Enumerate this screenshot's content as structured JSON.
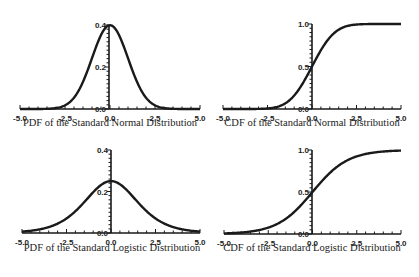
{
  "chart_data": [
    {
      "type": "line",
      "title": "PDF of the Standard Normal Distribution",
      "xlabel": "",
      "ylabel": "",
      "xlim": [
        -5.0,
        5.0
      ],
      "ylim": [
        0.0,
        0.4
      ],
      "x_ticks": [
        "-5.0",
        "-2.5",
        "0.0",
        "2.5",
        "5.0"
      ],
      "y_ticks": [
        "0.0",
        "0.2",
        "0.4"
      ],
      "grid": false,
      "legend": null,
      "function": "normal_pdf",
      "series": [
        {
          "name": "pdf",
          "x": [
            -5,
            -4,
            -3,
            -2.5,
            -2,
            -1.5,
            -1,
            -0.5,
            0,
            0.5,
            1,
            1.5,
            2,
            2.5,
            3,
            4,
            5
          ],
          "y": [
            0.0,
            0.0001,
            0.0044,
            0.0175,
            0.054,
            0.1295,
            0.242,
            0.3521,
            0.3989,
            0.3521,
            0.242,
            0.1295,
            0.054,
            0.0175,
            0.0044,
            0.0001,
            0.0
          ]
        }
      ],
      "box": {
        "x0": 20,
        "x1": 200,
        "y0": 109,
        "y1": 25,
        "axis_x": 109
      }
    },
    {
      "type": "line",
      "title": "CDF of the Standard Normal Distribution",
      "xlabel": "",
      "ylabel": "",
      "xlim": [
        -5.0,
        5.0
      ],
      "ylim": [
        0.0,
        1.0
      ],
      "x_ticks": [
        "-5.0",
        "-2.5",
        "0.0",
        "2.5",
        "5.0"
      ],
      "y_ticks": [
        "0.0",
        "0.5",
        "1.0"
      ],
      "grid": false,
      "legend": null,
      "function": "normal_cdf",
      "series": [
        {
          "name": "cdf",
          "x": [
            -5,
            -3,
            -2.5,
            -2,
            -1.5,
            -1,
            -0.5,
            0,
            0.5,
            1,
            1.5,
            2,
            2.5,
            3,
            5
          ],
          "y": [
            0.0,
            0.0013,
            0.0062,
            0.0228,
            0.0668,
            0.1587,
            0.3085,
            0.5,
            0.6915,
            0.8413,
            0.9332,
            0.9772,
            0.9938,
            0.9987,
            1.0
          ]
        }
      ],
      "box": {
        "x0": 223,
        "x1": 401,
        "y0": 109,
        "y1": 24,
        "axis_x": 312
      }
    },
    {
      "type": "line",
      "title": "PDF of the Standard Logistic Distribution",
      "xlabel": "",
      "ylabel": "",
      "xlim": [
        -5.0,
        5.0
      ],
      "ylim": [
        0.0,
        0.4
      ],
      "x_ticks": [
        "-5.0",
        "-2.5",
        "0.0",
        "2.5",
        "5.0"
      ],
      "y_ticks": [
        "0.0",
        "0.2",
        "0.4"
      ],
      "grid": false,
      "legend": null,
      "function": "logistic_pdf",
      "series": [
        {
          "name": "pdf",
          "x": [
            -5,
            -4,
            -3,
            -2,
            -1,
            0,
            1,
            2,
            3,
            4,
            5
          ],
          "y": [
            0.0066,
            0.0177,
            0.0452,
            0.105,
            0.1966,
            0.25,
            0.1966,
            0.105,
            0.0452,
            0.0177,
            0.0066
          ]
        }
      ],
      "box": {
        "x0": 22,
        "x1": 200,
        "y0": 233,
        "y1": 150,
        "axis_x": 111
      }
    },
    {
      "type": "line",
      "title": "CDF of the Standard Logistic Distribution",
      "xlabel": "",
      "ylabel": "",
      "xlim": [
        -5.0,
        5.0
      ],
      "ylim": [
        0.0,
        1.0
      ],
      "x_ticks": [
        "-5.0",
        "-2.5",
        "0.0",
        "2.5",
        "5.0"
      ],
      "y_ticks": [
        "0.0",
        "0.5",
        "1.0"
      ],
      "grid": false,
      "legend": null,
      "function": "logistic_cdf",
      "series": [
        {
          "name": "cdf",
          "x": [
            -5,
            -4,
            -3,
            -2,
            -1,
            0,
            1,
            2,
            3,
            4,
            5
          ],
          "y": [
            0.0067,
            0.018,
            0.0474,
            0.1192,
            0.2689,
            0.5,
            0.7311,
            0.8808,
            0.9526,
            0.982,
            0.9933
          ]
        }
      ],
      "box": {
        "x0": 224,
        "x1": 401,
        "y0": 234,
        "y1": 150,
        "axis_x": 312
      }
    }
  ],
  "captions": {
    "normal_pdf": "PDF of the Standard Normal Distribution",
    "normal_cdf": "CDF of the Standard Normal Distribution",
    "logistic_pdf": "PDF of the Standard Logistic Distribution",
    "logistic_cdf": "CDF of the Standard Logistic Distribution"
  },
  "style": {
    "line_color": "#1a1a1a",
    "axis_color": "#1a1a1a",
    "background": "#ffffff"
  }
}
